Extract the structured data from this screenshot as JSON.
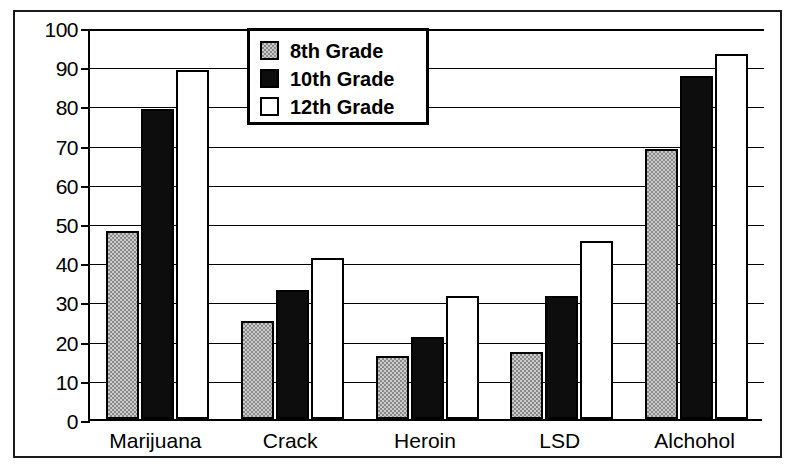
{
  "chart_data": {
    "type": "bar",
    "title": "",
    "subtitle": "",
    "xlabel": "",
    "ylabel": "",
    "ylim": [
      0,
      100
    ],
    "yticks": [
      0,
      10,
      20,
      30,
      40,
      50,
      60,
      70,
      80,
      90,
      100
    ],
    "ytick_labels": [
      "0",
      "10",
      "20",
      "30",
      "40",
      "50",
      "60",
      "70",
      "80",
      "90",
      "100"
    ],
    "grid": true,
    "grid_axis": "y",
    "legend_position": "upper center",
    "categories": [
      "Marijuana",
      "Crack",
      "Heroin",
      "LSD",
      "Alchohol"
    ],
    "series": [
      {
        "name": "8th Grade",
        "color": "#8a8a8a",
        "pattern": "checkered-gray",
        "values": [
          48,
          25,
          16,
          17,
          69
        ]
      },
      {
        "name": "10th Grade",
        "color": "#0d0d0d",
        "pattern": "solid-black",
        "values": [
          79,
          33,
          21,
          31.5,
          87.5
        ]
      },
      {
        "name": "12th Grade",
        "color": "#ffffff",
        "pattern": "open-white",
        "values": [
          89,
          41,
          31.5,
          45.5,
          93
        ]
      }
    ]
  },
  "legend": {
    "entries": [
      {
        "label": "8th Grade",
        "swatch": "gray-checkered-swatch"
      },
      {
        "label": "10th Grade",
        "swatch": "black-swatch"
      },
      {
        "label": "12th Grade",
        "swatch": "white-swatch"
      }
    ]
  },
  "colors": {
    "axis": "#000000",
    "frame": "#1a1a1a",
    "background": "#ffffff",
    "series_8th": "#8a8a8a",
    "series_10th": "#0d0d0d",
    "series_12th": "#ffffff"
  }
}
